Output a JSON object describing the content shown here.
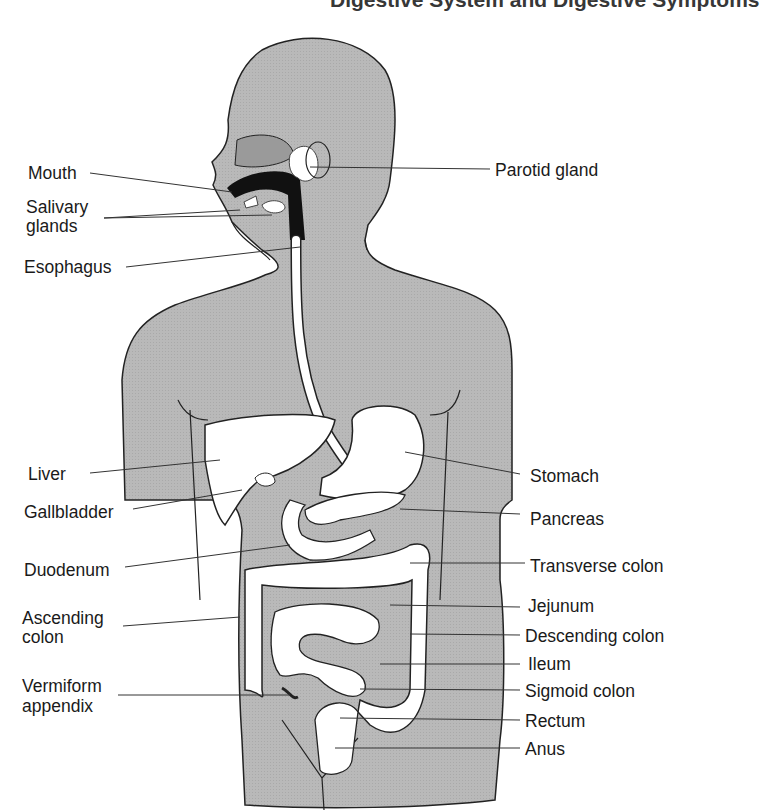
{
  "title": "Digestive System and Digestive Symptoms",
  "diagram": {
    "colors": {
      "body_fill": "#b8b8b8",
      "organ_fill": "#ffffff",
      "outline": "#222222",
      "dark_cavity": "#111111"
    },
    "labels_left": [
      {
        "id": "mouth",
        "text": "Mouth"
      },
      {
        "id": "salivary",
        "text": "Salivary\nglands",
        "line1": "Salivary",
        "line2": "glands"
      },
      {
        "id": "esophagus",
        "text": "Esophagus"
      },
      {
        "id": "liver",
        "text": "Liver"
      },
      {
        "id": "gallbladder",
        "text": "Gallbladder"
      },
      {
        "id": "duodenum",
        "text": "Duodenum"
      },
      {
        "id": "ascending",
        "line1": "Ascending",
        "line2": "colon"
      },
      {
        "id": "appendix",
        "line1": "Vermiform",
        "line2": "appendix"
      }
    ],
    "labels_right": [
      {
        "id": "parotid",
        "text": "Parotid gland"
      },
      {
        "id": "stomach",
        "text": "Stomach"
      },
      {
        "id": "pancreas",
        "text": "Pancreas"
      },
      {
        "id": "transverse",
        "text": "Transverse colon"
      },
      {
        "id": "jejunum",
        "text": "Jejunum"
      },
      {
        "id": "descending",
        "text": "Descending colon"
      },
      {
        "id": "ileum",
        "text": "Ileum"
      },
      {
        "id": "sigmoid",
        "text": "Sigmoid colon"
      },
      {
        "id": "rectum",
        "text": "Rectum"
      },
      {
        "id": "anus",
        "text": "Anus"
      }
    ]
  }
}
